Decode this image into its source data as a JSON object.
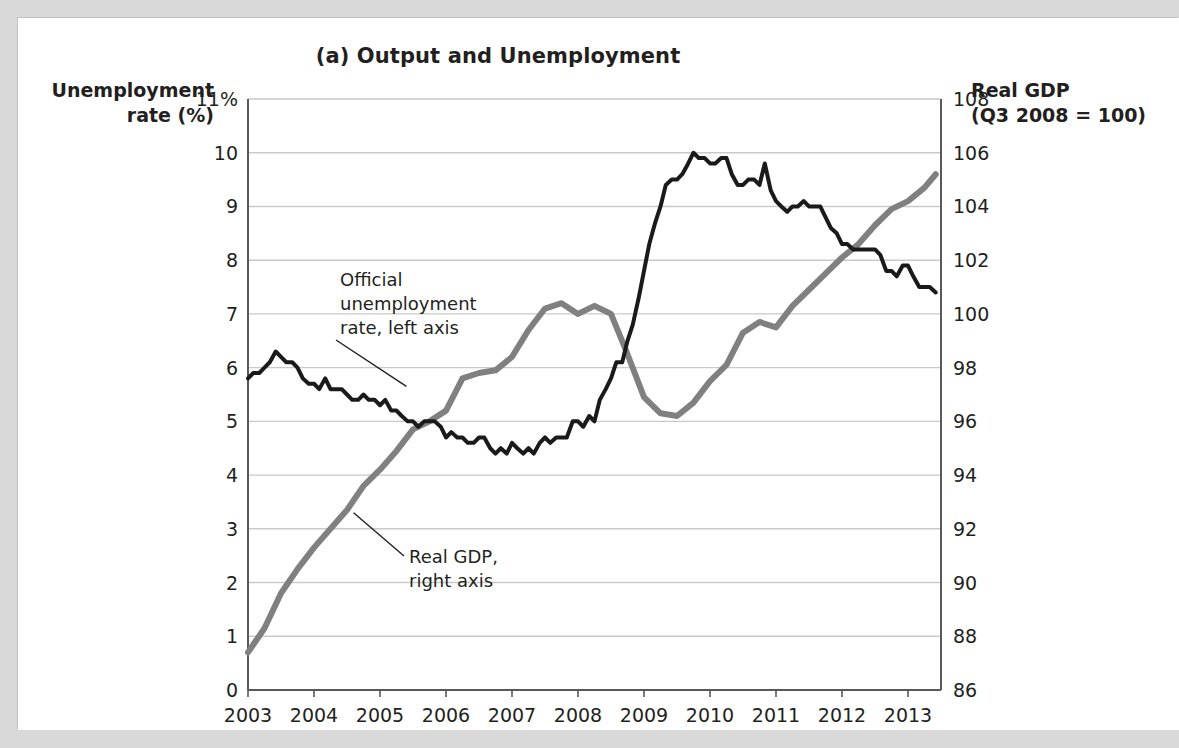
{
  "figure": {
    "title": "(a) Output and Unemployment",
    "left_axis_title_line1": "Unemployment",
    "left_axis_title_line2": "rate (%)",
    "right_axis_title_line1": "Real GDP",
    "right_axis_title_line2": "(Q3 2008 = 100)"
  },
  "annotations": {
    "unemployment": {
      "line1": "Official",
      "line2": "unemployment",
      "line3": "rate, left axis"
    },
    "gdp": {
      "line1": "Real GDP,",
      "line2": "right axis"
    }
  },
  "colors": {
    "unemployment_line": "#1a1a1a",
    "gdp_line": "#808080",
    "gridline": "#c9c9c9",
    "axis": "#595959",
    "text": "#231f20",
    "page_background": "#d9d9d9",
    "card_background": "#ffffff"
  },
  "chart_data": {
    "type": "line",
    "title": "(a) Output and Unemployment",
    "xlabel": "",
    "grid": true,
    "legend": "annotated-inline",
    "x_ticklabels": [
      "2003",
      "2004",
      "2005",
      "2006",
      "2007",
      "2008",
      "2009",
      "2010",
      "2011",
      "2012",
      "2013"
    ],
    "xlim": [
      2003,
      2013.5
    ],
    "left_axis": {
      "label": "Unemployment rate (%)",
      "ylim": [
        0,
        11
      ],
      "ticks": [
        0,
        1,
        2,
        3,
        4,
        5,
        6,
        7,
        8,
        9,
        10,
        11
      ],
      "ticklabels": [
        "0",
        "1",
        "2",
        "3",
        "4",
        "5",
        "6",
        "7",
        "8",
        "9",
        "10",
        "11%"
      ]
    },
    "right_axis": {
      "label": "Real GDP (Q3 2008 = 100)",
      "ylim": [
        86,
        108
      ],
      "ticks": [
        86,
        88,
        90,
        92,
        94,
        96,
        98,
        100,
        102,
        104,
        106,
        108
      ],
      "ticklabels": [
        "86",
        "88",
        "90",
        "92",
        "94",
        "96",
        "98",
        "100",
        "102",
        "104",
        "106",
        "108"
      ]
    },
    "series": [
      {
        "name": "Official unemployment rate, left axis",
        "axis": "left",
        "color": "#1a1a1a",
        "units": "percent",
        "x": [
          2003.0,
          2003.08,
          2003.17,
          2003.25,
          2003.33,
          2003.42,
          2003.5,
          2003.58,
          2003.67,
          2003.75,
          2003.83,
          2003.92,
          2004.0,
          2004.08,
          2004.17,
          2004.25,
          2004.33,
          2004.42,
          2004.5,
          2004.58,
          2004.67,
          2004.75,
          2004.83,
          2004.92,
          2005.0,
          2005.08,
          2005.17,
          2005.25,
          2005.33,
          2005.42,
          2005.5,
          2005.58,
          2005.67,
          2005.75,
          2005.83,
          2005.92,
          2006.0,
          2006.08,
          2006.17,
          2006.25,
          2006.33,
          2006.42,
          2006.5,
          2006.58,
          2006.67,
          2006.75,
          2006.83,
          2006.92,
          2007.0,
          2007.08,
          2007.17,
          2007.25,
          2007.33,
          2007.42,
          2007.5,
          2007.58,
          2007.67,
          2007.75,
          2007.83,
          2007.92,
          2008.0,
          2008.08,
          2008.17,
          2008.25,
          2008.33,
          2008.42,
          2008.5,
          2008.58,
          2008.67,
          2008.75,
          2008.83,
          2008.92,
          2009.0,
          2009.08,
          2009.17,
          2009.25,
          2009.33,
          2009.42,
          2009.5,
          2009.58,
          2009.67,
          2009.75,
          2009.83,
          2009.92,
          2010.0,
          2010.08,
          2010.17,
          2010.25,
          2010.33,
          2010.42,
          2010.5,
          2010.58,
          2010.67,
          2010.75,
          2010.83,
          2010.92,
          2011.0,
          2011.08,
          2011.17,
          2011.25,
          2011.33,
          2011.42,
          2011.5,
          2011.58,
          2011.67,
          2011.75,
          2011.83,
          2011.92,
          2012.0,
          2012.08,
          2012.17,
          2012.25,
          2012.33,
          2012.42,
          2012.5,
          2012.58,
          2012.67,
          2012.75,
          2012.83,
          2012.92,
          2013.0,
          2013.08,
          2013.17,
          2013.25,
          2013.33,
          2013.42
        ],
        "y": [
          5.8,
          5.9,
          5.9,
          6.0,
          6.1,
          6.3,
          6.2,
          6.1,
          6.1,
          6.0,
          5.8,
          5.7,
          5.7,
          5.6,
          5.8,
          5.6,
          5.6,
          5.6,
          5.5,
          5.4,
          5.4,
          5.5,
          5.4,
          5.4,
          5.3,
          5.4,
          5.2,
          5.2,
          5.1,
          5.0,
          5.0,
          4.9,
          5.0,
          5.0,
          5.0,
          4.9,
          4.7,
          4.8,
          4.7,
          4.7,
          4.6,
          4.6,
          4.7,
          4.7,
          4.5,
          4.4,
          4.5,
          4.4,
          4.6,
          4.5,
          4.4,
          4.5,
          4.4,
          4.6,
          4.7,
          4.6,
          4.7,
          4.7,
          4.7,
          5.0,
          5.0,
          4.9,
          5.1,
          5.0,
          5.4,
          5.6,
          5.8,
          6.1,
          6.1,
          6.5,
          6.8,
          7.3,
          7.8,
          8.3,
          8.7,
          9.0,
          9.4,
          9.5,
          9.5,
          9.6,
          9.8,
          10.0,
          9.9,
          9.9,
          9.8,
          9.8,
          9.9,
          9.9,
          9.6,
          9.4,
          9.4,
          9.5,
          9.5,
          9.4,
          9.8,
          9.3,
          9.1,
          9.0,
          8.9,
          9.0,
          9.0,
          9.1,
          9.0,
          9.0,
          9.0,
          8.8,
          8.6,
          8.5,
          8.3,
          8.3,
          8.2,
          8.2,
          8.2,
          8.2,
          8.2,
          8.1,
          7.8,
          7.8,
          7.7,
          7.9,
          7.9,
          7.7,
          7.5,
          7.5,
          7.5,
          7.4
        ]
      },
      {
        "name": "Real GDP, right axis",
        "axis": "right",
        "color": "#808080",
        "units": "index, Q3 2008 = 100",
        "x": [
          2003.0,
          2003.25,
          2003.5,
          2003.75,
          2004.0,
          2004.25,
          2004.5,
          2004.75,
          2005.0,
          2005.25,
          2005.5,
          2005.75,
          2006.0,
          2006.25,
          2006.5,
          2006.75,
          2007.0,
          2007.25,
          2007.5,
          2007.75,
          2008.0,
          2008.25,
          2008.5,
          2008.75,
          2009.0,
          2009.25,
          2009.5,
          2009.75,
          2010.0,
          2010.25,
          2010.5,
          2010.75,
          2011.0,
          2011.25,
          2011.5,
          2011.75,
          2012.0,
          2012.25,
          2012.5,
          2012.75,
          2013.0,
          2013.25,
          2013.42
        ],
        "y": [
          87.4,
          88.3,
          89.6,
          90.5,
          91.3,
          92.0,
          92.7,
          93.6,
          94.2,
          94.9,
          95.7,
          96.0,
          96.4,
          97.6,
          97.8,
          97.9,
          98.4,
          99.4,
          100.2,
          100.4,
          100.0,
          100.3,
          100.0,
          98.5,
          96.9,
          96.3,
          96.2,
          96.7,
          97.5,
          98.1,
          99.3,
          99.7,
          99.5,
          100.3,
          100.9,
          101.5,
          102.1,
          102.6,
          103.3,
          103.9,
          104.2,
          104.7,
          105.2
        ]
      }
    ],
    "annotations": [
      {
        "text": "Official unemployment rate, left axis",
        "target_x": 2005.4,
        "target_y_left": 5.65
      },
      {
        "text": "Real GDP, right axis",
        "target_x": 2004.6,
        "target_y_right": 92.6
      }
    ]
  }
}
